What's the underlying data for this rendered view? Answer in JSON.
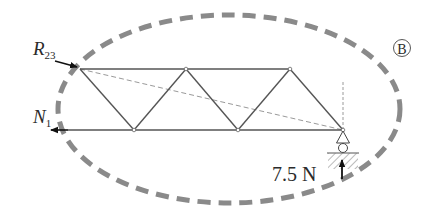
{
  "diagram": {
    "type": "truss free-body diagram",
    "region_label": "B",
    "labels": {
      "top_force": {
        "main": "R",
        "sub": "23"
      },
      "bottom_force": {
        "main": "N",
        "sub": "1"
      },
      "reaction": "7.5 N"
    },
    "colors": {
      "member": "#555555",
      "boundary": "#8a8a8a",
      "guide": "#9a9a9a",
      "arrow": "#111111"
    },
    "nodes": {
      "top": [
        [
          80,
          69
        ],
        [
          186,
          69
        ],
        [
          290,
          69
        ]
      ],
      "bottom": [
        [
          134,
          130
        ],
        [
          238,
          130
        ],
        [
          343,
          130
        ]
      ]
    }
  }
}
